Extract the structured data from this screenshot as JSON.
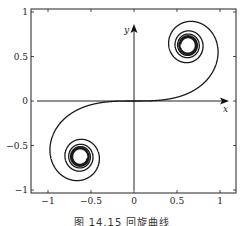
{
  "chart_data": {
    "type": "line",
    "title": "",
    "caption": "图 14.15  回旋曲线",
    "xlabel": "x",
    "ylabel": "y",
    "xlim": [
      -1.2,
      1.2
    ],
    "ylim": [
      -1.05,
      1.05
    ],
    "xticks": [
      -1,
      -0.5,
      0,
      0.5,
      1
    ],
    "xtick_labels": [
      "−1",
      "−0.5",
      "0",
      "0.5",
      "1"
    ],
    "yticks": [
      -1,
      -0.5,
      0,
      0.5,
      1
    ],
    "ytick_labels": [
      "−1",
      "−0.5",
      "0",
      "0.5",
      "1"
    ],
    "grid": false,
    "legend": null,
    "series": [
      {
        "name": "Euler spiral (clothoid)",
        "parametric": "x(t)=∫0^t cos(u²)du, y(t)=∫0^t sin(u²)du",
        "t_range": [
          -6,
          6
        ],
        "limit_points": [
          [
            0.627,
            0.627
          ],
          [
            -0.627,
            -0.627
          ]
        ],
        "color": "#1a1a1a"
      }
    ]
  }
}
